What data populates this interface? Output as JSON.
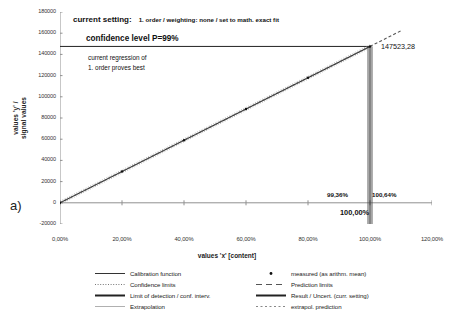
{
  "panel": {
    "label": "a)"
  },
  "chart_data": {
    "type": "line",
    "title": "",
    "xlabel": "values 'x' [content]",
    "ylabel": "values 'y' /\nsignal values",
    "ylabel_line1": "values 'y' /",
    "ylabel_line2": "signal values",
    "xlim": [
      0,
      120
    ],
    "ylim": [
      -20000,
      180000
    ],
    "xticks": [
      0,
      20,
      40,
      60,
      80,
      100,
      120
    ],
    "xticklabels": [
      "0,00%",
      "20,00%",
      "40,00%",
      "60,00%",
      "80,00%",
      "100,00%",
      "120,00%"
    ],
    "yticks": [
      -20000,
      0,
      20000,
      40000,
      60000,
      80000,
      100000,
      120000,
      140000,
      160000,
      180000
    ],
    "yticklabels": [
      "-20000",
      "0",
      "20000",
      "40000",
      "60000",
      "80000",
      "100000",
      "120000",
      "140000",
      "160000",
      "180000"
    ],
    "grid": false,
    "legend_position": "bottom",
    "series": [
      {
        "name": "Calibration function",
        "style": "solid",
        "x": [
          0,
          100
        ],
        "y": [
          0,
          147523.28
        ]
      },
      {
        "name": "measured (as arithm. mean)",
        "style": "markers",
        "x": [
          0,
          20,
          40,
          60,
          80,
          100
        ],
        "y": [
          0,
          29505,
          59009,
          88514,
          118019,
          147523
        ]
      },
      {
        "name": "extrapol. prediction",
        "style": "dashed",
        "x": [
          100,
          110
        ],
        "y": [
          147523.28,
          162275.6
        ]
      }
    ],
    "result": {
      "y_value": "147523,28",
      "y_value_num": 147523.28,
      "x_lower": "99,36%",
      "x_upper": "100,64%",
      "x_center": "100,00%",
      "x_lower_num": 99.36,
      "x_upper_num": 100.64,
      "x_center_num": 100.0
    }
  },
  "annotations": {
    "setting_label": "current setting:",
    "setting_detail": "1. order / weighting: none / set to math. exact fit",
    "confidence": "confidence level P=99%",
    "regression_line1": "current regression of",
    "regression_line2": "1. order proves best"
  },
  "legend": {
    "left": [
      {
        "label": "Calibration function",
        "key": "solid-thin"
      },
      {
        "label": "Confidence limits",
        "key": "dotted"
      },
      {
        "label": "Limit of detection / conf. interv.",
        "key": "solid-thick"
      },
      {
        "label": "Extrapolation",
        "key": "solid-light"
      }
    ],
    "right": [
      {
        "label": "measured (as arithm. mean)",
        "key": "marker-dot"
      },
      {
        "label": "Prediction limits",
        "key": "dashed-long"
      },
      {
        "label": "Result / Uncert. (curr. setting)",
        "key": "solid-thick"
      },
      {
        "label": "extrapol. prediction",
        "key": "dashed-fine"
      }
    ]
  },
  "colors": {
    "axis": "#808080",
    "line": "#333333",
    "text": "#111111",
    "background": "#ffffff"
  }
}
